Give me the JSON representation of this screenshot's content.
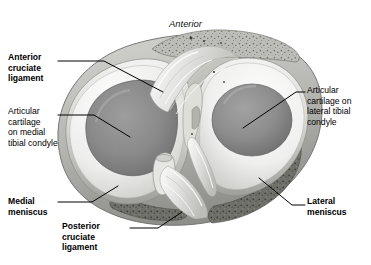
{
  "figure": {
    "orientation_top": "Anterior",
    "view": "superior-view-tibial-plateau"
  },
  "labels": [
    {
      "id": "acl",
      "text": "Anterior\ncruciate\nligament",
      "bold": true,
      "side": "left"
    },
    {
      "id": "art_medial",
      "text": "Articular\ncartilage\non medial\ntibial condyle",
      "bold": false,
      "side": "left"
    },
    {
      "id": "medial_men",
      "text": "Medial\nmeniscus",
      "bold": true,
      "side": "left"
    },
    {
      "id": "pcl",
      "text": "Posterior\ncruciate\nligament",
      "bold": true,
      "side": "bottom"
    },
    {
      "id": "art_lateral",
      "text": "Articular\ncartilage on\nlateral tibial\ncondyle",
      "bold": false,
      "side": "right"
    },
    {
      "id": "lateral_men",
      "text": "Lateral\nmeniscus",
      "bold": true,
      "side": "right"
    }
  ],
  "colors": {
    "background": "#ffffff",
    "leader_line": "#000000",
    "text": "#000000",
    "meniscus": "#ededeb",
    "meniscus_shadow": "#c9c9c7",
    "cartilage_medial": "#8c8c8c",
    "cartilage_lateral": "#8f8f8f",
    "cartilage_dark": "#6f6f6f",
    "bone_tissue": "#b9b9b6",
    "bone_speckle": "#6a6a68",
    "ligament_fiber": "#dcdcda",
    "outline": "#555555",
    "posterior_rim": "#55554f"
  }
}
